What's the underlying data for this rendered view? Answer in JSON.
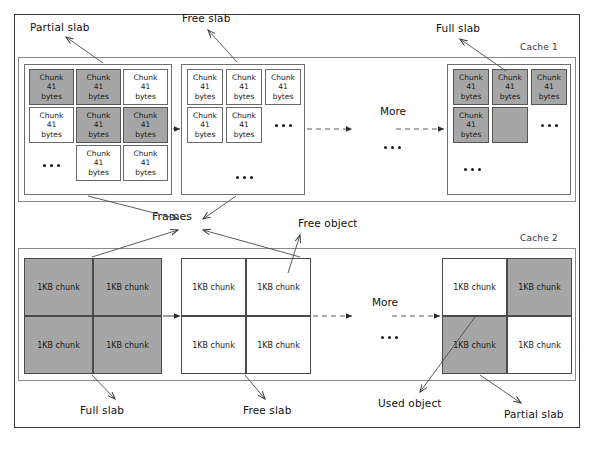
{
  "diagram": {
    "title_present": false,
    "colors": {
      "used_object_fill": "#a6a6a6",
      "free_object_fill": "#ffffff",
      "border": "#4a4a4a",
      "frame": "#3a3a3a"
    },
    "caches": [
      {
        "id": "cache1",
        "label": "Cache 1",
        "object_label_lines": [
          "Chunk",
          "41",
          "bytes"
        ],
        "slabs": [
          {
            "id": "cache1-partial-slab",
            "kind": "partial",
            "annotation": "Partial slab",
            "cells": [
              {
                "text_lines": [
                  "Chunk",
                  "41",
                  "bytes"
                ],
                "state": "used"
              },
              {
                "text_lines": [
                  "Chunk",
                  "41",
                  "bytes"
                ],
                "state": "used"
              },
              {
                "text_lines": [
                  "Chunk",
                  "41",
                  "bytes"
                ],
                "state": "free"
              },
              {
                "text_lines": [
                  "Chunk",
                  "41",
                  "bytes"
                ],
                "state": "free"
              },
              {
                "text_lines": [
                  "Chunk",
                  "41",
                  "bytes"
                ],
                "state": "used"
              },
              {
                "text_lines": [
                  "Chunk",
                  "41",
                  "bytes"
                ],
                "state": "used"
              },
              {
                "text_lines": [
                  "Chunk",
                  "41",
                  "bytes"
                ],
                "state": "free"
              },
              {
                "text_lines": [
                  "Chunk",
                  "41",
                  "bytes"
                ],
                "state": "free"
              }
            ],
            "ellipsis": [
              "bottom-left"
            ]
          },
          {
            "id": "cache1-free-slab",
            "kind": "free",
            "annotation": "Free slab",
            "cells": [
              {
                "text_lines": [
                  "Chunk",
                  "41",
                  "bytes"
                ],
                "state": "free"
              },
              {
                "text_lines": [
                  "Chunk",
                  "41",
                  "bytes"
                ],
                "state": "free"
              },
              {
                "text_lines": [
                  "Chunk",
                  "41",
                  "bytes"
                ],
                "state": "free"
              },
              {
                "text_lines": [
                  "Chunk",
                  "41",
                  "bytes"
                ],
                "state": "free"
              },
              {
                "text_lines": [
                  "Chunk",
                  "41",
                  "bytes"
                ],
                "state": "free"
              }
            ],
            "ellipsis": [
              "row2-right",
              "bottom-center"
            ]
          },
          {
            "id": "cache1-full-slab",
            "kind": "full",
            "annotation": "Full slab",
            "cells": [
              {
                "text_lines": [
                  "Chunk",
                  "41",
                  "bytes"
                ],
                "state": "used"
              },
              {
                "text_lines": [
                  "Chunk",
                  "41",
                  "bytes"
                ],
                "state": "used"
              },
              {
                "text_lines": [
                  "Chunk",
                  "41",
                  "bytes"
                ],
                "state": "used"
              },
              {
                "text_lines": [
                  "Chunk",
                  "41",
                  "bytes"
                ],
                "state": "used"
              },
              {
                "text_lines": [
                  "",
                  "",
                  ""
                ],
                "state": "used"
              }
            ],
            "ellipsis": [
              "row2-right",
              "bottom-left"
            ]
          }
        ],
        "more_label": "More",
        "more_ellipsis": true
      },
      {
        "id": "cache2",
        "label": "Cache 2",
        "object_label_lines": [
          "1KB chunk"
        ],
        "slabs": [
          {
            "id": "cache2-full-slab",
            "kind": "full",
            "annotation": "Full slab",
            "cells": [
              {
                "text_lines": [
                  "1KB chunk"
                ],
                "state": "used"
              },
              {
                "text_lines": [
                  "1KB chunk"
                ],
                "state": "used"
              },
              {
                "text_lines": [
                  "1KB chunk"
                ],
                "state": "used"
              },
              {
                "text_lines": [
                  "1KB chunk"
                ],
                "state": "used"
              }
            ],
            "ellipsis": []
          },
          {
            "id": "cache2-free-slab",
            "kind": "free",
            "annotation": "Free slab",
            "cells": [
              {
                "text_lines": [
                  "1KB chunk"
                ],
                "state": "free"
              },
              {
                "text_lines": [
                  "1KB chunk"
                ],
                "state": "free"
              },
              {
                "text_lines": [
                  "1KB chunk"
                ],
                "state": "free"
              },
              {
                "text_lines": [
                  "1KB chunk"
                ],
                "state": "free"
              }
            ],
            "ellipsis": []
          },
          {
            "id": "cache2-partial-slab",
            "kind": "partial",
            "annotation": "Partial slab",
            "cells": [
              {
                "text_lines": [
                  "1KB chunk"
                ],
                "state": "free"
              },
              {
                "text_lines": [
                  "1KB chunk"
                ],
                "state": "used"
              },
              {
                "text_lines": [
                  "1KB chunk"
                ],
                "state": "used"
              },
              {
                "text_lines": [
                  "1KB chunk"
                ],
                "state": "free"
              }
            ],
            "ellipsis": []
          }
        ],
        "more_label": "More",
        "more_ellipsis": true
      }
    ],
    "annotations": {
      "partial_slab_top": "Partial slab",
      "free_slab_top": "Free slab",
      "full_slab_top": "Full slab",
      "frames": "Frames",
      "free_object": "Free object",
      "full_slab_bottom": "Full slab",
      "free_slab_bottom": "Free slab",
      "used_object": "Used object",
      "partial_slab_bottom": "Partial slab"
    },
    "cell_texts": {
      "chunk41_line1": "Chunk",
      "chunk41_line2": "41",
      "chunk41_line3": "bytes",
      "chunk1kb": "1KB chunk"
    },
    "more_label": "More"
  }
}
